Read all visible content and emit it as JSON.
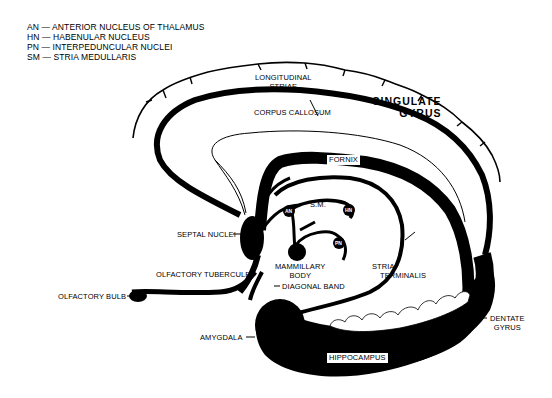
{
  "legend": [
    {
      "abbr": "AN",
      "sep": "—",
      "text": "Anterior Nucleus of Thalamus"
    },
    {
      "abbr": "HN",
      "sep": "—",
      "text": "Habenular Nucleus"
    },
    {
      "abbr": "PN",
      "sep": "—",
      "text": "Interpeduncular Nuclei"
    },
    {
      "abbr": "SM",
      "sep": "—",
      "text": "Stria Medullaris"
    }
  ],
  "labels": {
    "longitudinal_striae": [
      "Longitudinal",
      "Striae"
    ],
    "corpus_callosum": "Corpus Callosum",
    "cingulate_gyrus": [
      "Cingulate",
      "Gyrus"
    ],
    "fornix": "Fornix",
    "sm": "S.M.",
    "an": "AN",
    "hn": "HN",
    "pn": "PN",
    "septal_nuclei": "Septal Nuclei",
    "olfactory_tubercule": "Olfactory Tubercule",
    "olfactory_bulb": "Olfactory Bulb",
    "mammillary_body": [
      "Mammillary",
      "Body"
    ],
    "diagonal_band": "Diagonal Band",
    "stria_terminalis": [
      "Stria",
      "Terminalis"
    ],
    "amygdala": "Amygdala",
    "dentate_gyrus": [
      "Dentate",
      "Gyrus"
    ],
    "hippocampus": "Hippocampus"
  },
  "colors": {
    "ink": "#000000",
    "paper": "#ffffff"
  }
}
